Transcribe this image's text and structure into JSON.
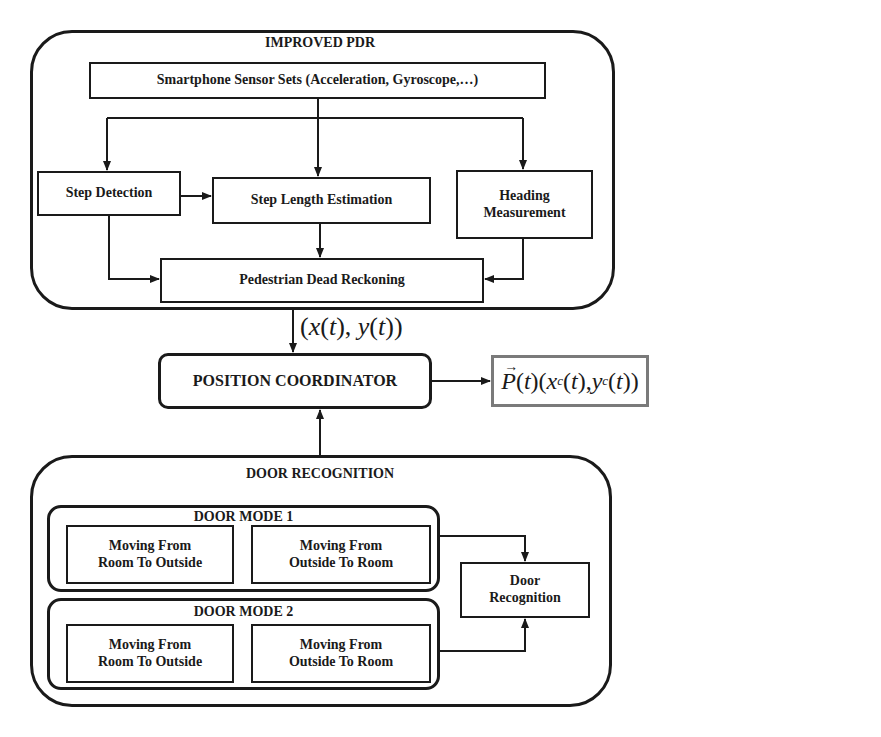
{
  "improved_pdr": {
    "title": "IMPROVED PDR",
    "sensor_box": "Smartphone Sensor Sets (Acceleration, Gyroscope,…)",
    "step_detection": "Step Detection",
    "step_length_estimation": "Step Length Estimation",
    "heading_measurement_line1": "Heading",
    "heading_measurement_line2": "Measurement",
    "pedestrian_dead_reckoning": "Pedestrian Dead Reckoning"
  },
  "pdr_output_label": "(x(t), y(t))",
  "position_coordinator": "POSITION COORDINATOR",
  "final_output": {
    "label": "P(t)(xc(t), yc(t))",
    "border_color": "#7a7a7a"
  },
  "door_recognition": {
    "title": "DOOR RECOGNITION",
    "modes": [
      {
        "title": "DOOR MODE 1",
        "boxes": [
          {
            "line1": "Moving From",
            "line2": "Room To Outside"
          },
          {
            "line1": "Moving From",
            "line2": "Outside To Room"
          }
        ]
      },
      {
        "title": "DOOR MODE 2",
        "boxes": [
          {
            "line1": "Moving From",
            "line2": "Room To Outside"
          },
          {
            "line1": "Moving From",
            "line2": "Outside To Room"
          }
        ]
      }
    ],
    "recognition_box_line1": "Door",
    "recognition_box_line2": "Recognition"
  },
  "colors": {
    "stroke": "#1a1a1a",
    "background": "#ffffff"
  }
}
